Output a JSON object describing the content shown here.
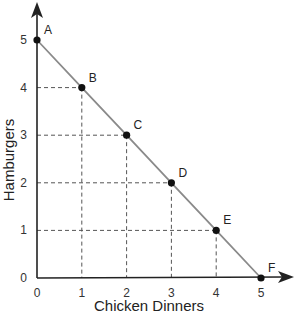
{
  "chart_data": {
    "type": "line",
    "title": "",
    "xlabel": "Chicken Dinners",
    "ylabel": "Hamburgers",
    "xlim": [
      0,
      5
    ],
    "ylim": [
      0,
      5
    ],
    "x_ticks": [
      "0",
      "1",
      "2",
      "3",
      "4",
      "5"
    ],
    "y_ticks": [
      "0",
      "1",
      "2",
      "3",
      "4",
      "5"
    ],
    "grid": false,
    "dashed_guides": true,
    "legend": null,
    "series": [
      {
        "name": "Production Possibilities Frontier",
        "points": [
          {
            "label": "A",
            "x": 0,
            "y": 5
          },
          {
            "label": "B",
            "x": 1,
            "y": 4
          },
          {
            "label": "C",
            "x": 2,
            "y": 3
          },
          {
            "label": "D",
            "x": 3,
            "y": 2
          },
          {
            "label": "E",
            "x": 4,
            "y": 1
          },
          {
            "label": "F",
            "x": 5,
            "y": 0
          }
        ]
      }
    ]
  },
  "colors": {
    "line": "#8a8a8a",
    "axis": "#222222",
    "point": "#111111",
    "guide": "#555555"
  }
}
